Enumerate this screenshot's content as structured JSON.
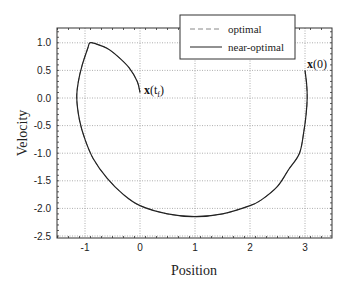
{
  "chart_data": {
    "type": "line",
    "title": "",
    "xlabel": "Position",
    "ylabel": "Velocity",
    "xlim": [
      -1.5,
      3.5
    ],
    "ylim": [
      -2.5,
      1.25
    ],
    "xticks": [
      -1,
      0,
      1,
      2,
      3
    ],
    "xtick_labels": [
      "-1",
      "0",
      "1",
      "2",
      "3"
    ],
    "yticks": [
      1.0,
      0.5,
      0.0,
      -0.5,
      -1.0,
      -1.5,
      -2.0,
      -2.5
    ],
    "ytick_labels": [
      "1.0",
      "0.5",
      "0.0",
      "-0.5",
      "-1.0",
      "-1.5",
      "-2.0",
      "-2.5"
    ],
    "grid": true,
    "legend_position": "upper right",
    "series": [
      {
        "name": "optimal",
        "style": "dashed",
        "color": "#888888",
        "x": [
          3.0,
          3.03,
          3.04,
          3.02,
          2.98,
          2.9,
          2.7,
          2.5,
          2.2,
          2.0,
          1.5,
          1.0,
          0.5,
          0.0,
          -0.3,
          -0.6,
          -0.85,
          -1.0,
          -1.1,
          -1.15,
          -1.12,
          -1.05,
          -0.95,
          -0.91,
          -0.8,
          -0.6,
          -0.4,
          -0.2,
          -0.05,
          0.0
        ],
        "y": [
          0.5,
          0.25,
          0.0,
          -0.3,
          -0.6,
          -1.0,
          -1.3,
          -1.6,
          -1.85,
          -1.95,
          -2.1,
          -2.15,
          -2.1,
          -1.95,
          -1.75,
          -1.45,
          -1.1,
          -0.75,
          -0.4,
          0.0,
          0.3,
          0.6,
          0.9,
          1.0,
          0.98,
          0.9,
          0.75,
          0.55,
          0.3,
          0.1
        ]
      },
      {
        "name": "near-optimal",
        "style": "solid",
        "color": "#222222",
        "x": [
          3.0,
          3.03,
          3.04,
          3.02,
          2.98,
          2.9,
          2.7,
          2.5,
          2.2,
          2.0,
          1.5,
          1.0,
          0.5,
          0.0,
          -0.3,
          -0.6,
          -0.85,
          -1.0,
          -1.1,
          -1.15,
          -1.12,
          -1.05,
          -0.95,
          -0.91,
          -0.8,
          -0.6,
          -0.4,
          -0.2,
          -0.05,
          0.0
        ],
        "y": [
          0.5,
          0.25,
          0.0,
          -0.3,
          -0.6,
          -1.0,
          -1.3,
          -1.6,
          -1.85,
          -1.95,
          -2.1,
          -2.15,
          -2.1,
          -1.95,
          -1.75,
          -1.45,
          -1.1,
          -0.75,
          -0.4,
          0.0,
          0.3,
          0.6,
          0.9,
          1.0,
          0.98,
          0.9,
          0.75,
          0.55,
          0.3,
          0.1
        ]
      }
    ],
    "annotations": [
      {
        "text_bold": "x",
        "text_rest": "(0)",
        "x": 3.0,
        "y": 0.5,
        "meaning": "initial state"
      },
      {
        "text_bold": "x",
        "text_rest": "(t",
        "sub": "f",
        "close": ")",
        "x": 0.0,
        "y": 0.1,
        "meaning": "final state"
      }
    ]
  },
  "legend": {
    "items": [
      {
        "label": "optimal",
        "style": "dashed"
      },
      {
        "label": "near-optimal",
        "style": "solid"
      }
    ]
  },
  "annotations": {
    "start": {
      "bold": "x",
      "rest": "(0)"
    },
    "end": {
      "bold": "x",
      "rest": "(t",
      "sub": "f",
      "close": ")"
    }
  },
  "axes": {
    "xlabel": "Position",
    "ylabel": "Velocity"
  }
}
